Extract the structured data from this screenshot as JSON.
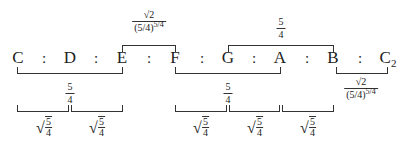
{
  "diagram": {
    "notes": [
      {
        "label": "C",
        "sub": ""
      },
      {
        "label": "D",
        "sub": ""
      },
      {
        "label": "E",
        "sub": ""
      },
      {
        "label": "F",
        "sub": ""
      },
      {
        "label": "G",
        "sub": ""
      },
      {
        "label": "A",
        "sub": ""
      },
      {
        "label": "B",
        "sub": ""
      },
      {
        "label": "C",
        "sub": "2"
      }
    ],
    "separator": ":",
    "ratios": {
      "five_fourths_num": "5",
      "five_fourths_den": "4",
      "semitone_num": "√2",
      "semitone_den_base": "(5/4)",
      "semitone_den_exp": "5/4",
      "tone_root_num": "5",
      "tone_root_den": "4",
      "radical": "√"
    },
    "brackets_above": [
      {
        "from": "E",
        "to": "F",
        "label": "√2 / (5/4)^(5/4)"
      },
      {
        "from": "G",
        "to": "B",
        "label": "5/4"
      }
    ],
    "brackets_below_major": [
      {
        "from": "C",
        "to": "E",
        "label": "5/4"
      },
      {
        "from": "F",
        "to": "A",
        "label": "5/4"
      },
      {
        "from": "B",
        "to": "C2",
        "label": "√2 / (5/4)^(5/4)"
      }
    ],
    "brackets_below_minor": [
      {
        "from": "C",
        "to": "D",
        "label": "√(5/4)"
      },
      {
        "from": "D",
        "to": "E",
        "label": "√(5/4)"
      },
      {
        "from": "F",
        "to": "G",
        "label": "√(5/4)"
      },
      {
        "from": "G",
        "to": "A",
        "label": "√(5/4)"
      },
      {
        "from": "A",
        "to": "B",
        "label": "√(5/4)"
      }
    ]
  }
}
